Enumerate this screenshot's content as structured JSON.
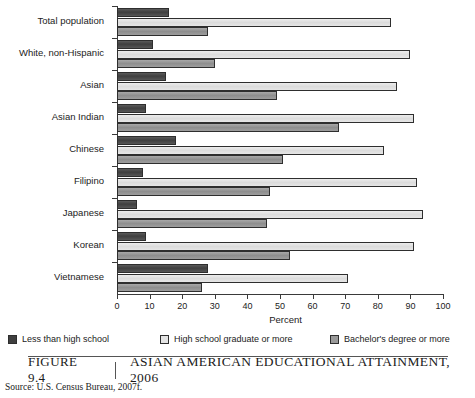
{
  "figure": {
    "number_label": "Figure 9.4",
    "title": "Asian American Educational Attainment, 2006",
    "source": "Source: U.S. Census Bureau, 2007f."
  },
  "legend": {
    "position": "below-plot",
    "items": [
      {
        "label": "Less than high school",
        "color": "#3f3f3f"
      },
      {
        "label": "High school graduate or more",
        "color": "#e4e4e4"
      },
      {
        "label": "Bachelor's degree or more",
        "color": "#9a9a9a"
      }
    ]
  },
  "axis": {
    "x_title": "Percent",
    "x_ticks": [
      "0",
      "10",
      "20",
      "30",
      "40",
      "50",
      "60",
      "70",
      "80",
      "90",
      "100"
    ]
  },
  "chart_data": {
    "type": "bar",
    "orientation": "horizontal",
    "title": "Asian American Educational Attainment, 2006",
    "xlabel": "Percent",
    "ylabel": "",
    "xlim": [
      0,
      100
    ],
    "xticks": [
      0,
      10,
      20,
      30,
      40,
      50,
      60,
      70,
      80,
      90,
      100
    ],
    "grid": false,
    "legend_position": "bottom",
    "categories": [
      "Total population",
      "White, non-Hispanic",
      "Asian",
      "Asian Indian",
      "Chinese",
      "Filipino",
      "Japanese",
      "Korean",
      "Vietnamese"
    ],
    "series": [
      {
        "name": "Less than high school",
        "color": "#3f3f3f",
        "values": [
          16,
          11,
          15,
          9,
          18,
          8,
          6,
          9,
          28
        ]
      },
      {
        "name": "High school graduate or more",
        "color": "#e4e4e4",
        "values": [
          84,
          90,
          86,
          91,
          82,
          92,
          94,
          91,
          71
        ]
      },
      {
        "name": "Bachelor's degree or more",
        "color": "#9a9a9a",
        "values": [
          28,
          30,
          49,
          68,
          51,
          47,
          46,
          53,
          26
        ]
      }
    ]
  }
}
